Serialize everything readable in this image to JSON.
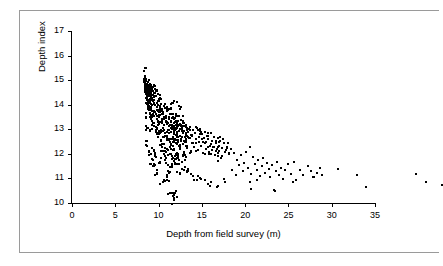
{
  "chart_data": {
    "type": "scatter",
    "title": "",
    "xlabel": "Depth from field survey (m)",
    "ylabel": "Depth index",
    "xlim": [
      0,
      35
    ],
    "ylim": [
      10,
      17
    ],
    "xticks": [
      0,
      5,
      10,
      15,
      20,
      25,
      30,
      35
    ],
    "yticks": [
      10,
      11,
      12,
      13,
      14,
      15,
      16,
      17
    ],
    "grid": false,
    "legend": "none",
    "marker": "square",
    "marker_color": "#000000",
    "series": [
      {
        "name": "Depth index vs field survey depth",
        "points": [
          [
            0.05,
            16.62
          ],
          [
            0.08,
            16.3
          ],
          [
            0.1,
            16.05
          ],
          [
            0.12,
            15.95
          ],
          [
            0.15,
            16.15
          ],
          [
            0.18,
            15.8
          ],
          [
            0.2,
            16.0
          ],
          [
            0.22,
            15.7
          ],
          [
            0.25,
            16.25
          ],
          [
            0.28,
            15.55
          ],
          [
            0.3,
            15.9
          ],
          [
            0.32,
            16.1
          ],
          [
            0.35,
            15.45
          ],
          [
            0.38,
            15.75
          ],
          [
            0.4,
            16.0
          ],
          [
            0.42,
            15.3
          ],
          [
            0.45,
            15.85
          ],
          [
            0.48,
            15.6
          ],
          [
            0.5,
            16.2
          ],
          [
            0.52,
            15.4
          ],
          [
            0.55,
            15.95
          ],
          [
            0.58,
            15.2
          ],
          [
            0.6,
            15.7
          ],
          [
            0.62,
            16.05
          ],
          [
            0.65,
            15.5
          ],
          [
            0.68,
            14.9
          ],
          [
            0.7,
            15.8
          ],
          [
            0.72,
            15.35
          ],
          [
            0.75,
            16.1
          ],
          [
            0.78,
            15.1
          ],
          [
            0.8,
            15.65
          ],
          [
            0.82,
            14.75
          ],
          [
            0.85,
            15.9
          ],
          [
            0.88,
            15.25
          ],
          [
            0.9,
            14.6
          ],
          [
            0.92,
            15.55
          ],
          [
            0.95,
            16.0
          ],
          [
            0.98,
            15.0
          ],
          [
            1.0,
            15.45
          ],
          [
            1.05,
            14.85
          ],
          [
            1.1,
            15.75
          ],
          [
            1.15,
            14.4
          ],
          [
            1.2,
            15.3
          ],
          [
            1.25,
            15.9
          ],
          [
            1.3,
            14.95
          ],
          [
            1.35,
            15.6
          ],
          [
            1.4,
            14.25
          ],
          [
            1.45,
            15.15
          ],
          [
            1.5,
            15.8
          ],
          [
            1.55,
            14.7
          ],
          [
            1.6,
            15.4
          ],
          [
            1.65,
            13.95
          ],
          [
            1.7,
            15.05
          ],
          [
            1.75,
            14.5
          ],
          [
            1.8,
            15.65
          ],
          [
            1.85,
            14.15
          ],
          [
            1.9,
            14.85
          ],
          [
            1.95,
            15.3
          ],
          [
            2.0,
            13.8
          ],
          [
            2.05,
            14.6
          ],
          [
            2.1,
            15.1
          ],
          [
            2.15,
            14.3
          ],
          [
            2.2,
            13.65
          ],
          [
            2.25,
            14.95
          ],
          [
            2.3,
            14.45
          ],
          [
            2.35,
            15.2
          ],
          [
            2.4,
            13.5
          ],
          [
            2.45,
            14.1
          ],
          [
            2.5,
            14.8
          ],
          [
            2.55,
            13.35
          ],
          [
            2.6,
            14.55
          ],
          [
            2.65,
            15.0
          ],
          [
            2.7,
            13.9
          ],
          [
            2.75,
            14.25
          ],
          [
            2.8,
            13.2
          ],
          [
            2.85,
            14.7
          ],
          [
            2.9,
            14.4
          ],
          [
            2.95,
            13.75
          ],
          [
            3.0,
            14.9
          ],
          [
            3.05,
            13.55
          ],
          [
            3.1,
            14.15
          ],
          [
            3.15,
            14.6
          ],
          [
            3.2,
            13.05
          ],
          [
            3.25,
            14.35
          ],
          [
            3.3,
            13.85
          ],
          [
            3.35,
            14.75
          ],
          [
            3.4,
            13.4
          ],
          [
            3.45,
            14.05
          ],
          [
            3.5,
            14.5
          ],
          [
            3.55,
            12.9
          ],
          [
            3.6,
            14.25
          ],
          [
            3.65,
            13.7
          ],
          [
            3.7,
            14.85
          ],
          [
            3.75,
            13.25
          ],
          [
            3.8,
            14.4
          ],
          [
            3.85,
            13.95
          ],
          [
            3.9,
            14.6
          ],
          [
            3.95,
            13.1
          ],
          [
            4.0,
            14.2
          ],
          [
            4.05,
            13.6
          ],
          [
            4.1,
            14.45
          ],
          [
            4.15,
            14.0
          ],
          [
            4.2,
            13.45
          ],
          [
            4.25,
            14.65
          ],
          [
            4.3,
            13.8
          ],
          [
            4.35,
            14.3
          ],
          [
            4.4,
            12.95
          ],
          [
            4.45,
            14.1
          ],
          [
            4.5,
            13.65
          ],
          [
            4.55,
            14.5
          ],
          [
            4.6,
            13.3
          ],
          [
            4.65,
            14.2
          ],
          [
            4.7,
            13.95
          ],
          [
            4.75,
            14.4
          ],
          [
            4.8,
            13.15
          ],
          [
            4.85,
            14.05
          ],
          [
            4.9,
            13.75
          ],
          [
            4.95,
            14.3
          ],
          [
            5.0,
            13.5
          ],
          [
            5.1,
            14.15
          ],
          [
            5.2,
            13.9
          ],
          [
            5.3,
            14.35
          ],
          [
            5.4,
            13.35
          ],
          [
            5.5,
            14.0
          ],
          [
            5.6,
            13.7
          ],
          [
            5.7,
            14.25
          ],
          [
            5.8,
            13.55
          ],
          [
            5.9,
            14.1
          ],
          [
            6.0,
            13.85
          ],
          [
            6.1,
            14.3
          ],
          [
            6.2,
            13.4
          ],
          [
            6.3,
            13.95
          ],
          [
            6.4,
            13.75
          ],
          [
            6.5,
            14.2
          ],
          [
            6.6,
            13.6
          ],
          [
            6.7,
            14.05
          ],
          [
            6.8,
            13.3
          ],
          [
            6.9,
            13.9
          ],
          [
            7.0,
            14.15
          ],
          [
            7.1,
            13.7
          ],
          [
            7.2,
            13.45
          ],
          [
            7.3,
            14.0
          ],
          [
            7.4,
            13.85
          ],
          [
            7.5,
            13.25
          ],
          [
            7.6,
            13.6
          ],
          [
            7.7,
            14.1
          ],
          [
            7.8,
            13.4
          ],
          [
            7.9,
            13.8
          ],
          [
            8.0,
            13.55
          ],
          [
            8.1,
            13.95
          ],
          [
            8.2,
            13.2
          ],
          [
            8.3,
            13.7
          ],
          [
            8.4,
            13.45
          ],
          [
            8.5,
            13.9
          ],
          [
            8.6,
            13.3
          ],
          [
            8.7,
            13.6
          ],
          [
            8.8,
            13.8
          ],
          [
            8.9,
            13.1
          ],
          [
            9.0,
            13.5
          ],
          [
            9.2,
            13.7
          ],
          [
            9.4,
            13.35
          ],
          [
            9.6,
            13.55
          ],
          [
            9.8,
            13.25
          ],
          [
            10.0,
            13.45
          ],
          [
            10.2,
            12.6
          ],
          [
            10.4,
            13.3
          ],
          [
            10.6,
            12.4
          ],
          [
            10.8,
            13.0
          ],
          [
            11.0,
            12.8
          ],
          [
            11.2,
            13.2
          ],
          [
            11.4,
            12.55
          ],
          [
            11.6,
            12.9
          ],
          [
            11.8,
            13.35
          ],
          [
            12.0,
            12.7
          ],
          [
            12.2,
            13.55
          ],
          [
            12.4,
            12.45
          ],
          [
            12.6,
            13.15
          ],
          [
            12.8,
            12.85
          ],
          [
            13.0,
            12.6
          ],
          [
            13.2,
            13.0
          ],
          [
            13.4,
            12.35
          ],
          [
            13.6,
            12.75
          ],
          [
            13.8,
            13.1
          ],
          [
            14.0,
            12.5
          ],
          [
            14.2,
            12.9
          ],
          [
            14.4,
            12.65
          ],
          [
            14.6,
            12.3
          ],
          [
            14.8,
            12.8
          ],
          [
            15.0,
            11.8
          ],
          [
            15.2,
            12.55
          ],
          [
            15.4,
            12.95
          ],
          [
            15.6,
            12.4
          ],
          [
            15.8,
            12.7
          ],
          [
            16.0,
            12.25
          ],
          [
            16.3,
            12.6
          ],
          [
            16.6,
            12.85
          ],
          [
            17.0,
            12.45
          ],
          [
            17.3,
            12.95
          ],
          [
            17.6,
            12.2
          ],
          [
            18.0,
            12.6
          ],
          [
            18.4,
            12.4
          ],
          [
            19.0,
            12.75
          ],
          [
            19.3,
            12.55
          ],
          [
            19.6,
            12.3
          ],
          [
            20.0,
            12.5
          ],
          [
            20.3,
            12.7
          ],
          [
            20.6,
            12.4
          ],
          [
            22.4,
            12.65
          ],
          [
            24.6,
            12.4
          ],
          [
            25.6,
            11.9
          ],
          [
            31.4,
            12.45
          ],
          [
            32.6,
            12.1
          ],
          [
            34.4,
            12.0
          ],
          [
            3.0,
            11.65
          ],
          [
            3.5,
            11.4
          ],
          [
            3.6,
            11.65
          ],
          [
            2.2,
            12.1
          ],
          [
            2.6,
            12.3
          ],
          [
            1.5,
            12.45
          ],
          [
            1.2,
            12.75
          ],
          [
            0.9,
            13.05
          ],
          [
            0.6,
            13.35
          ],
          [
            0.4,
            13.6
          ],
          [
            5.4,
            12.45
          ],
          [
            5.8,
            12.2
          ],
          [
            6.2,
            12.35
          ],
          [
            6.6,
            12.25
          ],
          [
            7.0,
            12.2
          ],
          [
            7.6,
            11.95
          ],
          [
            8.4,
            11.9
          ],
          [
            9.4,
            12.1
          ],
          [
            12.4,
            11.85
          ],
          [
            15.1,
            11.75
          ],
          [
            3.4,
            15.35
          ],
          [
            4.0,
            15.2
          ],
          [
            8.8,
            13.95
          ],
          [
            12.2,
            12.1
          ],
          [
            13.1,
            12.2
          ],
          [
            17.2,
            12.1
          ],
          [
            19.5,
            12.3
          ],
          [
            2.8,
            12.55
          ],
          [
            4.6,
            12.6
          ],
          [
            1.8,
            12.95
          ],
          [
            0.3,
            14.3
          ],
          [
            0.25,
            14.75
          ],
          [
            0.7,
            14.2
          ],
          [
            1.1,
            13.4
          ],
          [
            1.4,
            13.15
          ],
          [
            2.4,
            13.0
          ],
          [
            3.2,
            12.8
          ],
          [
            4.2,
            12.45
          ],
          [
            5.0,
            12.55
          ]
        ]
      }
    ]
  },
  "axes": {
    "y_tick_labels": [
      "17",
      "16",
      "15",
      "14",
      "13",
      "12",
      "11",
      "10"
    ],
    "x_tick_labels": [
      "0",
      "5",
      "10",
      "15",
      "20",
      "25",
      "30",
      "35"
    ],
    "y_title": "Depth index",
    "x_title": "Depth from field survey (m)"
  }
}
